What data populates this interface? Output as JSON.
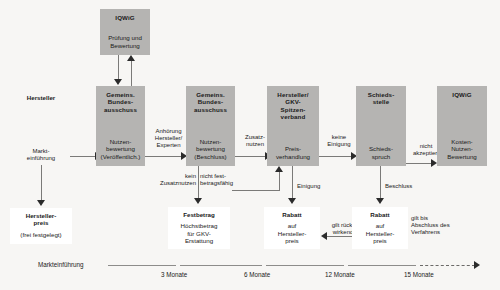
{
  "diagram": {
    "colors": {
      "actor_fill": "#b5b4b2",
      "canvas": "#f7f6f4",
      "line": "#7b7a78",
      "text": "#1a1a1a"
    }
  },
  "nodes": {
    "iqwig_top": {
      "header": "IQWiG",
      "body_line1": "Prüfung und",
      "body_line2": "Bewertung"
    },
    "hersteller": {
      "header": "Hersteller",
      "body_line1": "Markt-",
      "body_line2": "einführung"
    },
    "gba1": {
      "header_line1": "Gemeins.",
      "header_line2": "Bundes-",
      "header_line3": "ausschuss",
      "body_line1": "Nutzen-",
      "body_line2": "bewertung",
      "body_line3": "(Veröffentlich.)"
    },
    "gba2": {
      "header_line1": "Gemeins.",
      "header_line2": "Bundes-",
      "header_line3": "ausschuss",
      "body_line1": "Nutzen-",
      "body_line2": "bewertung",
      "body_line3": "(Beschluss)"
    },
    "verband": {
      "header_line1": "Hersteller/",
      "header_line2": "GKV-",
      "header_line3": "Spitzen-",
      "header_line4": "verband",
      "body_line1": "Preis-",
      "body_line2": "verhandlung"
    },
    "schiedsstelle": {
      "header_line1": "Schieds-",
      "header_line2": "stelle",
      "body_line1": "Schieds-",
      "body_line2": "spruch"
    },
    "iqwig_right": {
      "header": "IQWiG",
      "body_line1": "Kosten-",
      "body_line2": "Nutzen-",
      "body_line3": "Bewertung"
    },
    "herstellerpreis": {
      "header_line1": "Hersteller-",
      "header_line2": "preis",
      "body": "(frei festgelegt)"
    },
    "festbetrag": {
      "header": "Festbetrag",
      "body_line1": "Höchstbetrag",
      "body_line2": "für GKV-",
      "body_line3": "Erstattung"
    },
    "rabatt1": {
      "header": "Rabatt",
      "body_line1": "auf",
      "body_line2": "Hersteller-",
      "body_line3": "preis"
    },
    "rabatt2": {
      "header": "Rabatt",
      "body_line1": "auf",
      "body_line2": "Hersteller-",
      "body_line3": "preis"
    }
  },
  "edge_labels": {
    "anhoerung": {
      "line1": "Anhörung",
      "line2": "Hersteller/",
      "line3": "Experten"
    },
    "zusatznutzen": {
      "line1": "Zusatz-",
      "line2": "nutzen"
    },
    "kein_zusatznutzen": {
      "line1": "kein",
      "line2": "Zusatznutzen"
    },
    "nicht_festbetragsfaehig": {
      "line1": "nicht fest-",
      "line2": "betragsfähig"
    },
    "keine_einigung": {
      "line1": "keine",
      "line2": "Einigung"
    },
    "einigung": {
      "line1": "Einigung"
    },
    "beschluss": {
      "line1": "Beschluss"
    },
    "nicht_akzeptiert": {
      "line1": "nicht",
      "line2": "akzeptiert"
    },
    "gilt_rueckwirkend": {
      "line1": "gilt rück-",
      "line2": "wirkend"
    },
    "gilt_bis_abschluss": {
      "line1": "gilt bis",
      "line2": "Abschluss des",
      "line3": "Verfahrens"
    }
  },
  "timeline": {
    "start_label": "Markteinführung",
    "ticks": [
      {
        "label": "3 Monate"
      },
      {
        "label": "6 Monate"
      },
      {
        "label": "12 Monate"
      },
      {
        "label": "15 Monate"
      }
    ]
  }
}
